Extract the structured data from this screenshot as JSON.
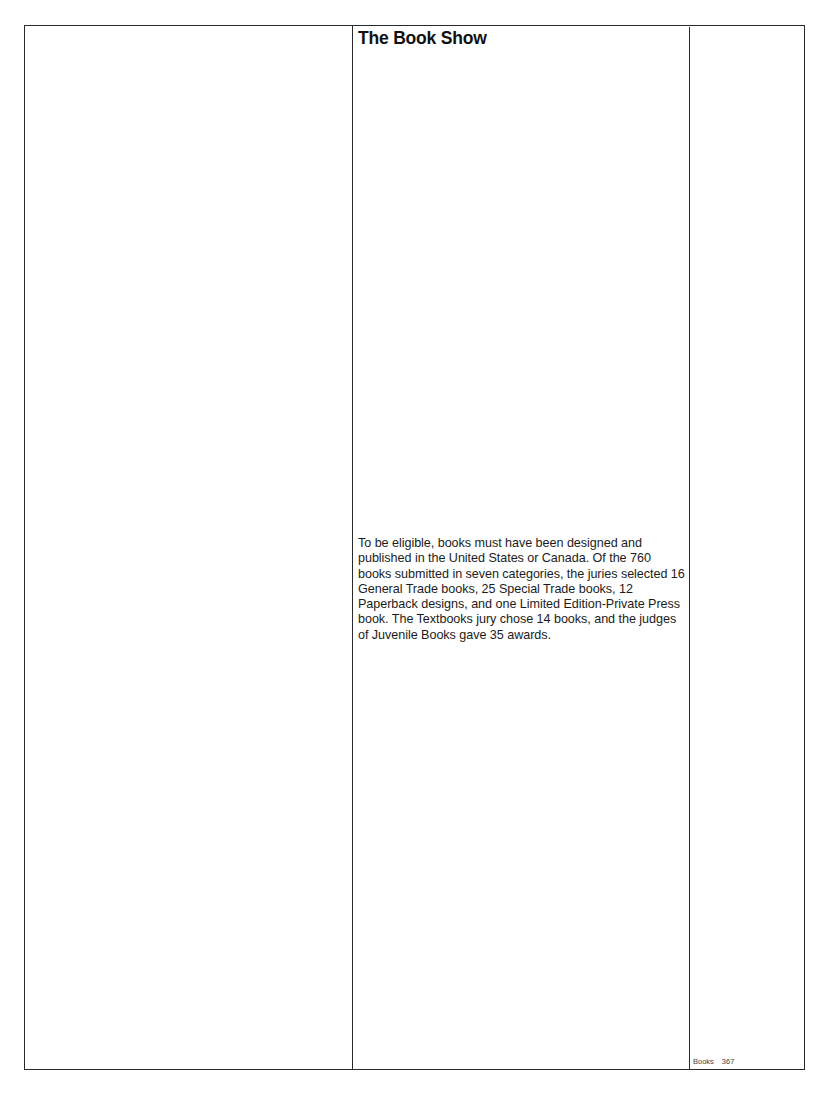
{
  "page": {
    "title": "The Book Show",
    "body": "To be eligible, books must have been designed and published in the United States or Canada. Of the 760 books submitted in seven categories, the juries selected 16 General Trade books, 25 Special Trade books, 12 Paperback designs, and one Limited Edition-Private Press book. The Textbooks jury chose 14 books, and the judges of Juvenile Books gave 35 awards.",
    "folio": {
      "section": "Books",
      "page_number": "367"
    }
  }
}
